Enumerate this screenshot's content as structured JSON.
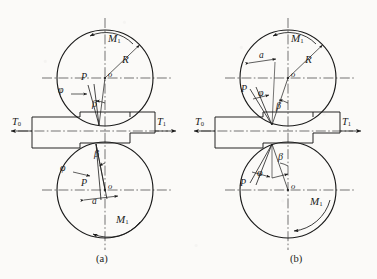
{
  "figure": {
    "background_color": "#fbfaf8",
    "line_color": "#1a1a1a",
    "panels": [
      {
        "id": "a",
        "caption": "(a)",
        "rolls": [
          {
            "position": "top",
            "labels": {
              "center": "o",
              "radius": "R",
              "torque": "M",
              "torque_sub": "1",
              "force": "P",
              "angle_phi": "φ",
              "angle_beta": "β"
            },
            "torque_direction": "counterclockwise"
          },
          {
            "position": "bottom",
            "labels": {
              "center": "o",
              "torque": "M",
              "torque_sub": "1",
              "force": "P",
              "angle_phi": "φ",
              "angle_beta": "β",
              "offset": "a"
            },
            "torque_direction": "counterclockwise"
          }
        ],
        "tensions": {
          "entry": {
            "symbol": "T",
            "sub": "0",
            "direction": "left"
          },
          "exit": {
            "symbol": "T",
            "sub": "1",
            "direction": "right"
          }
        }
      },
      {
        "id": "b",
        "caption": "(b)",
        "rolls": [
          {
            "position": "top",
            "labels": {
              "center": "o",
              "radius": "R",
              "torque": "M",
              "torque_sub": "1",
              "force": "P",
              "angle_phi": "φ",
              "angle_beta": "β",
              "offset": "a"
            },
            "torque_direction": "counterclockwise"
          },
          {
            "position": "bottom",
            "labels": {
              "center": "o",
              "torque": "M",
              "torque_sub": "1",
              "force": "P",
              "angle_phi": "φ",
              "angle_beta": "β"
            },
            "torque_direction": "clockwise"
          }
        ],
        "tensions": {
          "entry": {
            "symbol": "T",
            "sub": "0",
            "direction": "left"
          },
          "exit": {
            "symbol": "T",
            "sub": "1",
            "direction": "right"
          }
        }
      }
    ]
  },
  "labels": {
    "a_top_M": "M",
    "a_top_M_sub": "1",
    "a_top_R": "R",
    "a_top_P": "P",
    "a_top_phi": "φ",
    "a_top_beta": "β",
    "a_top_o": "o",
    "a_bot_M": "M",
    "a_bot_M_sub": "1",
    "a_bot_P": "P",
    "a_bot_phi": "φ",
    "a_bot_beta": "β",
    "a_bot_o": "o",
    "a_bot_a": "a",
    "a_T0": "T",
    "a_T0_sub": "0",
    "a_T1": "T",
    "a_T1_sub": "1",
    "a_caption": "(a)",
    "b_top_M": "M",
    "b_top_M_sub": "1",
    "b_top_R": "R",
    "b_top_P": "P",
    "b_top_phi": "φ",
    "b_top_beta": "β",
    "b_top_o": "o",
    "b_top_a": "a",
    "b_bot_M": "M",
    "b_bot_M_sub": "1",
    "b_bot_P": "P",
    "b_bot_phi": "φ",
    "b_bot_beta": "β",
    "b_bot_o": "o",
    "b_T0": "T",
    "b_T0_sub": "0",
    "b_T1": "T",
    "b_T1_sub": "1",
    "b_caption": "(b)"
  }
}
